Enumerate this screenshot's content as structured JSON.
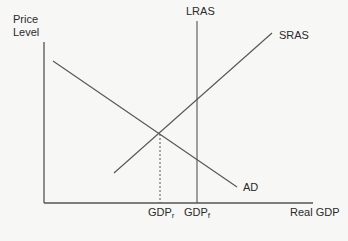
{
  "diagram": {
    "y_axis_label_line1": "Price",
    "y_axis_label_line2": "Level",
    "x_axis_label": "Real GDP",
    "curves": {
      "lras": "LRAS",
      "sras": "SRAS",
      "ad": "AD"
    },
    "x_ticks": {
      "gdp_r_main": "GDP",
      "gdp_r_sub": "r",
      "gdp_f_main": "GDP",
      "gdp_f_sub": "f"
    }
  }
}
